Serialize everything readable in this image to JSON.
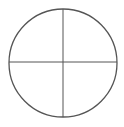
{
  "diagram": {
    "shape": "circle-divided-into-quadrants",
    "circle": {
      "cx": 63,
      "cy": 63,
      "r": 54
    },
    "stroke_color": "#555555",
    "background_color": "#ffffff",
    "quadrants": 4
  }
}
